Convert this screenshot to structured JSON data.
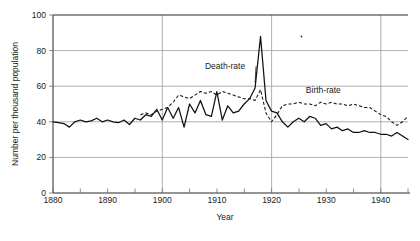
{
  "figure": {
    "background_color": "#ffffff",
    "ink_color": "#111111",
    "grid_color": "#9a9a9a"
  },
  "chart_data": {
    "type": "line",
    "title": "",
    "subtitle": "",
    "xlabel": "Year",
    "ylabel": "Number per thousand population",
    "xlim": [
      1880,
      1945
    ],
    "ylim": [
      0,
      100
    ],
    "grid": true,
    "grid_axes": "both",
    "legend_position": "inline-annotations",
    "y_ticks": [
      0,
      20,
      40,
      60,
      80,
      100
    ],
    "y_tick_labels": [
      "0",
      "20",
      "40",
      "60",
      "80",
      "100"
    ],
    "x_ticks": [
      1880,
      1885,
      1890,
      1895,
      1900,
      1905,
      1910,
      1915,
      1920,
      1925,
      1930,
      1935,
      1940,
      1945
    ],
    "x_tick_labels": [
      "1880",
      "",
      "1890",
      "",
      "1900",
      "",
      "1910",
      "",
      "1920",
      "",
      "1930",
      "",
      "1940",
      ""
    ],
    "x_major_gridlines": [
      1900,
      1920,
      1940
    ],
    "y_major_gridlines": [
      20,
      40,
      60,
      80
    ],
    "annotations": [
      {
        "text": "Death-rate",
        "x": 1911.5,
        "y": 69.5,
        "leader_to_x": 1917.0,
        "leader_to_y": 62.0
      },
      {
        "text": "Birth-rate",
        "x": 1929.5,
        "y": 56.0,
        "leader_to_x": null,
        "leader_to_y": null
      }
    ],
    "series": [
      {
        "name": "Death-rate",
        "style": "solid",
        "x": [
          1880,
          1881,
          1882,
          1883,
          1884,
          1885,
          1886,
          1887,
          1888,
          1889,
          1890,
          1891,
          1892,
          1893,
          1894,
          1895,
          1896,
          1897,
          1898,
          1899,
          1900,
          1901,
          1902,
          1903,
          1904,
          1905,
          1906,
          1907,
          1908,
          1909,
          1910,
          1911,
          1912,
          1913,
          1914,
          1915,
          1916,
          1917,
          1918,
          1919,
          1920,
          1921,
          1922,
          1923,
          1924,
          1925,
          1926,
          1927,
          1928,
          1929,
          1930,
          1931,
          1932,
          1933,
          1934,
          1935,
          1936,
          1937,
          1938,
          1939,
          1940,
          1941,
          1942,
          1943,
          1944,
          1945
        ],
        "values": [
          40,
          39.5,
          39,
          37,
          40,
          41,
          40,
          40.5,
          42,
          40,
          41,
          40,
          39.5,
          41,
          38.5,
          42,
          41,
          44,
          43,
          47,
          41,
          48,
          42,
          48,
          37,
          50,
          45,
          52,
          44,
          43,
          57,
          41,
          49,
          45,
          46,
          50,
          53,
          59,
          88,
          52,
          46,
          45,
          40,
          37,
          40,
          42,
          40,
          43,
          42,
          38,
          39,
          36,
          37,
          35,
          36,
          34,
          34,
          35,
          34,
          34,
          33,
          33,
          32,
          34,
          32,
          30
        ]
      },
      {
        "name": "Birth-rate",
        "style": "dashed",
        "x": [
          1896,
          1897,
          1898,
          1899,
          1900,
          1901,
          1902,
          1903,
          1904,
          1905,
          1906,
          1907,
          1908,
          1909,
          1910,
          1911,
          1912,
          1913,
          1914,
          1915,
          1916,
          1917,
          1918,
          1919,
          1920,
          1921,
          1922,
          1923,
          1924,
          1925,
          1926,
          1927,
          1928,
          1929,
          1930,
          1931,
          1932,
          1933,
          1934,
          1935,
          1936,
          1937,
          1938,
          1939,
          1940,
          1941,
          1942,
          1943,
          1944,
          1945
        ],
        "values": [
          44,
          45,
          44,
          46,
          47,
          48,
          51,
          55,
          54,
          53,
          55,
          57,
          56,
          57,
          55,
          57,
          56,
          55,
          54,
          53,
          53,
          52,
          58,
          45,
          40,
          44,
          49,
          50,
          50,
          51,
          50,
          50,
          49,
          51,
          50,
          51,
          50,
          50,
          49,
          50,
          49,
          48,
          48,
          46,
          44,
          43,
          40,
          38,
          40,
          43
        ]
      }
    ]
  }
}
